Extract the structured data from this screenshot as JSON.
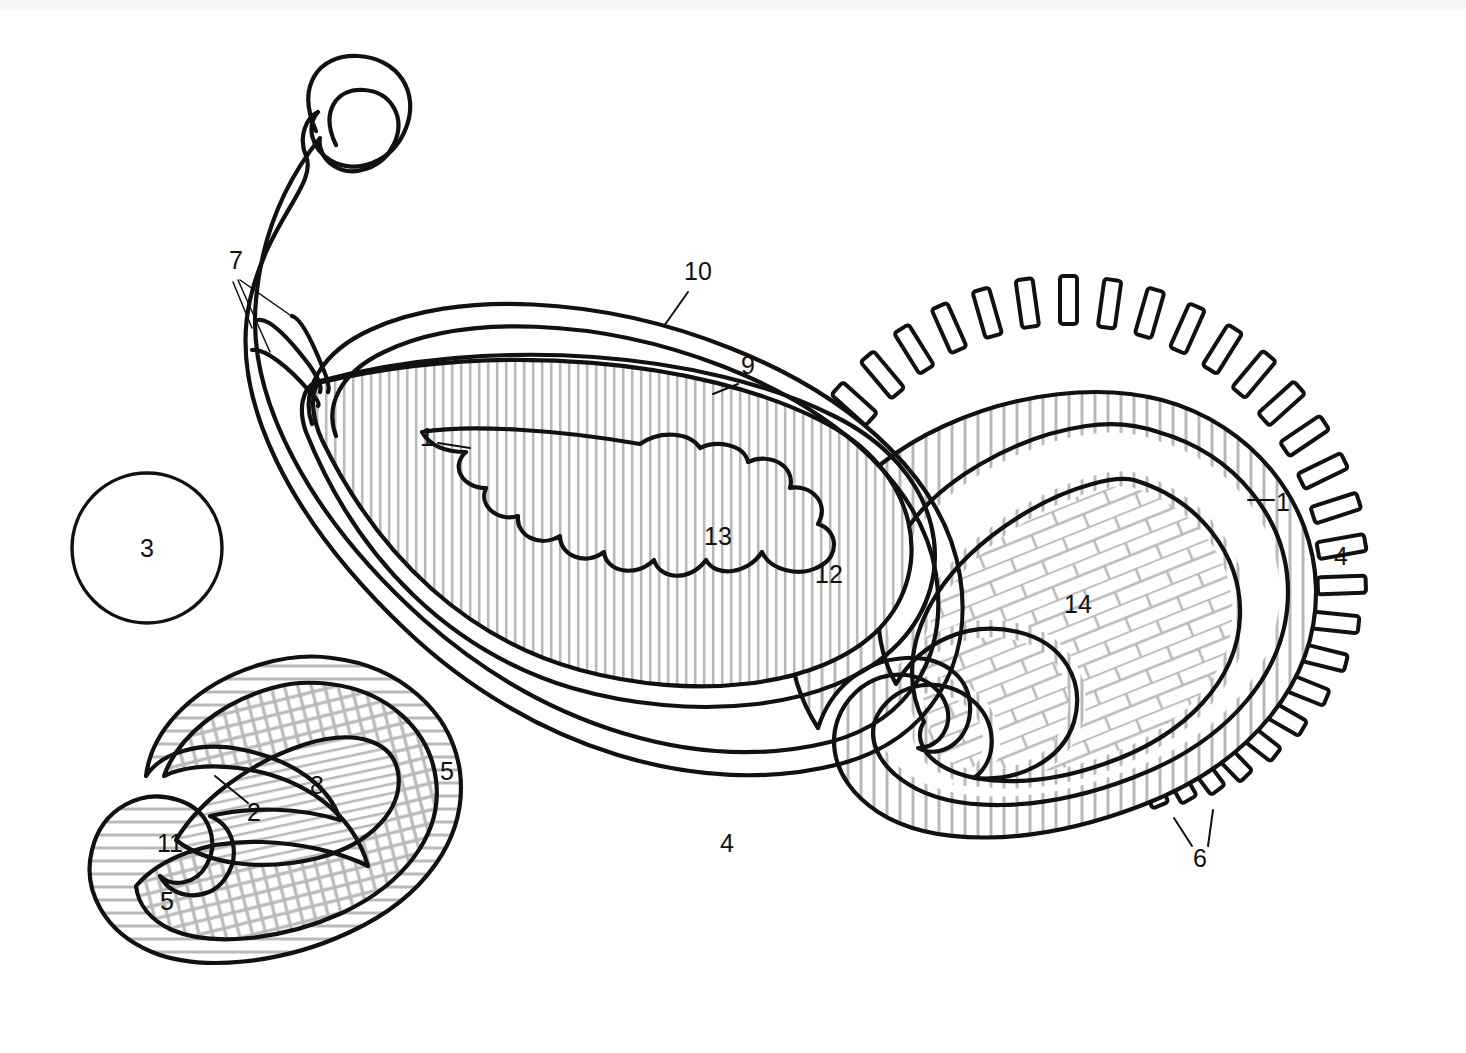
{
  "figure": {
    "background_color": "#ffffff",
    "line_color": "#111111",
    "hatch_color": "#b9b9b9",
    "top_strip_color": "#f5f6f7"
  },
  "labels": [
    {
      "id": "7",
      "text": "7",
      "x": 236,
      "y": 269,
      "target": "tendril-group"
    },
    {
      "id": "10",
      "text": "10",
      "x": 698,
      "y": 280,
      "target": "main-outer-rim"
    },
    {
      "id": "9",
      "text": "9",
      "x": 748,
      "y": 374,
      "target": "main-inner-rim"
    },
    {
      "id": "1a",
      "text": "1",
      "x": 427,
      "y": 438,
      "target": "main-flame-core"
    },
    {
      "id": "13",
      "text": "13",
      "x": 718,
      "y": 536,
      "target": "main-flame-field"
    },
    {
      "id": "12",
      "text": "12",
      "x": 829,
      "y": 574,
      "target": "main-inner-teardrop-field"
    },
    {
      "id": "3",
      "text": "3",
      "x": 147,
      "y": 548,
      "target": "plain-circle"
    },
    {
      "id": "1b",
      "text": "1",
      "x": 1281,
      "y": 503,
      "target": "right-inner-band"
    },
    {
      "id": "4a",
      "text": "4",
      "x": 1340,
      "y": 557,
      "target": "right-outer-band"
    },
    {
      "id": "14",
      "text": "14",
      "x": 1078,
      "y": 604,
      "target": "right-brick-field"
    },
    {
      "id": "5a",
      "text": "5",
      "x": 447,
      "y": 771,
      "target": "left-rim-band"
    },
    {
      "id": "8",
      "text": "8",
      "x": 317,
      "y": 785,
      "target": "left-inner-teardrop"
    },
    {
      "id": "2",
      "text": "2",
      "x": 254,
      "y": 812,
      "target": "left-inner-teardrop-edge"
    },
    {
      "id": "11",
      "text": "11",
      "x": 170,
      "y": 843,
      "target": "left-grid-field"
    },
    {
      "id": "4b",
      "text": "4",
      "x": 727,
      "y": 843,
      "target": "right-tail-band"
    },
    {
      "id": "6",
      "text": "6",
      "x": 1200,
      "y": 858,
      "target": "radial-dash-marks"
    },
    {
      "id": "5b",
      "text": "5",
      "x": 167,
      "y": 901,
      "target": "left-tail-band"
    }
  ],
  "components": [
    {
      "name": "plain-circle",
      "fill": "none",
      "note": "small plain circle marked 3"
    },
    {
      "name": "main-paisley",
      "fill": "vertical-hatch",
      "note": "large paisley, outer double rim 10, inner rim 9, field 12"
    },
    {
      "name": "main-flame",
      "fill": "vertical-hatch",
      "note": "organic flame swirl 13 with core 1"
    },
    {
      "name": "left-paisley",
      "fill": "cross-grid",
      "note": "lower-left paisley, band 5, field 11, inner teardrop 8 / edge 2"
    },
    {
      "name": "right-paisley",
      "fill": "brick",
      "note": "right paisley, brick field 14, bands 1 and 4, outer dashes 6"
    }
  ],
  "hatch_patterns": {
    "vertical-hatch": "close-spaced vertical grey lines",
    "diagonal-hatch": "close-spaced diagonal grey lines",
    "cross-grid": "offset grey grid of short ticks",
    "brick": "grey running-bond brick courses",
    "ladder": "grey rungs across a narrow band"
  },
  "radial_dashes": {
    "count": 34,
    "shape": "rounded-rectangle",
    "fill": "#ffffff",
    "stroke": "#111111"
  }
}
